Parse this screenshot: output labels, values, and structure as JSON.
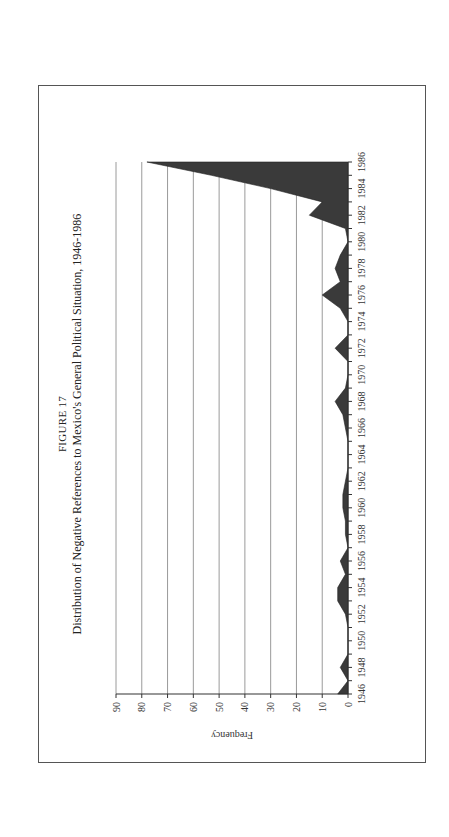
{
  "figure": {
    "label": "FIGURE 17",
    "title": "Distribution of Negative References to Mexico's General Political Situation, 1946-1986"
  },
  "chart_data": {
    "type": "area",
    "title": "Distribution of Negative References to Mexico's General Political Situation, 1946-1986",
    "figure_label": "FIGURE 17",
    "xlabel": "",
    "ylabel": "Frequency",
    "ylim": [
      0,
      90
    ],
    "yticks": [
      0,
      10,
      20,
      30,
      40,
      50,
      60,
      70,
      80,
      90
    ],
    "xtick_labels": [
      "1946",
      "1948",
      "1950",
      "1952",
      "1954",
      "1956",
      "1958",
      "1960",
      "1962",
      "1964",
      "1966",
      "1968",
      "1970",
      "1972",
      "1974",
      "1976",
      "1978",
      "1980",
      "1982",
      "1984",
      "1986"
    ],
    "grid": "horizontal",
    "legend": "none",
    "fill_color": "#3a3a3a",
    "orientation": "rotated -90 degrees on page",
    "x": [
      1946,
      1947,
      1948,
      1949,
      1950,
      1951,
      1952,
      1953,
      1954,
      1955,
      1956,
      1957,
      1958,
      1959,
      1960,
      1961,
      1962,
      1963,
      1964,
      1965,
      1966,
      1967,
      1968,
      1969,
      1970,
      1971,
      1972,
      1973,
      1974,
      1975,
      1976,
      1977,
      1978,
      1979,
      1980,
      1981,
      1982,
      1983,
      1984,
      1985,
      1986
    ],
    "values": [
      4,
      0,
      3,
      0,
      0,
      0,
      1,
      4,
      4,
      1,
      3,
      0,
      1,
      1,
      2,
      2,
      1,
      0,
      0,
      0,
      1,
      2,
      5,
      1,
      0,
      0,
      5,
      0,
      0,
      3,
      10,
      3,
      5,
      3,
      0,
      1,
      15,
      10,
      30,
      53,
      78
    ]
  }
}
